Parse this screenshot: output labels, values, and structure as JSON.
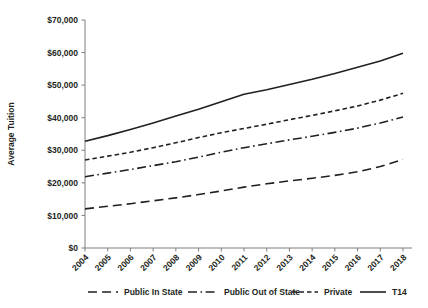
{
  "chart_data": {
    "type": "line",
    "title": "",
    "xlabel": "",
    "ylabel": "Average Tuition",
    "x": [
      2004,
      2005,
      2006,
      2007,
      2008,
      2009,
      2010,
      2011,
      2012,
      2013,
      2014,
      2015,
      2016,
      2017,
      2018
    ],
    "categories": [
      "2004",
      "2005",
      "2006",
      "2007",
      "2008",
      "2009",
      "2010",
      "2011",
      "2012",
      "2013",
      "2014",
      "2015",
      "2016",
      "2017",
      "2018"
    ],
    "xtick_labels": [
      "2004",
      "2005",
      "2006",
      "2007",
      "2008",
      "2009",
      "2010",
      "2011",
      "2012",
      "2013",
      "2014",
      "2015",
      "2016",
      "2017",
      "2018"
    ],
    "ytick_labels": [
      "$0",
      "$10,000",
      "$20,000",
      "$30,000",
      "$40,000",
      "$50,000",
      "$60,000",
      "$70,000"
    ],
    "yticks": [
      0,
      10000,
      20000,
      30000,
      40000,
      50000,
      60000,
      70000
    ],
    "ylim": [
      0,
      70000
    ],
    "xlim": [
      2004,
      2018
    ],
    "grid": false,
    "legend_position": "bottom",
    "series": [
      {
        "name": "Public In State",
        "dash": "long-dash",
        "color": "#231f20",
        "values": [
          12000,
          12800,
          13600,
          14500,
          15400,
          16400,
          17500,
          18700,
          19700,
          20600,
          21400,
          22300,
          23400,
          25000,
          27200
        ]
      },
      {
        "name": "Public Out of State",
        "dash": "dash-dot",
        "color": "#231f20",
        "values": [
          21900,
          23000,
          24100,
          25300,
          26500,
          27900,
          29400,
          30800,
          32000,
          33200,
          34300,
          35500,
          36800,
          38400,
          40200
        ]
      },
      {
        "name": "Private",
        "dash": "short-dash",
        "color": "#231f20",
        "values": [
          27000,
          28200,
          29400,
          30800,
          32300,
          33900,
          35400,
          36700,
          38000,
          39400,
          40700,
          42100,
          43600,
          45400,
          47500
        ]
      },
      {
        "name": "T14",
        "dash": "solid",
        "color": "#231f20",
        "values": [
          32800,
          34500,
          36400,
          38400,
          40500,
          42600,
          44900,
          47200,
          48600,
          50200,
          51800,
          53600,
          55500,
          57400,
          59800
        ]
      }
    ]
  },
  "legend": {
    "items": [
      {
        "label": "Public In State",
        "style": "long-dash"
      },
      {
        "label": "Public Out of State",
        "style": "dash-dot"
      },
      {
        "label": "Private",
        "style": "short-dash"
      },
      {
        "label": "T14",
        "style": "solid"
      }
    ]
  },
  "axes": {
    "y_title": "Average Tuition"
  }
}
